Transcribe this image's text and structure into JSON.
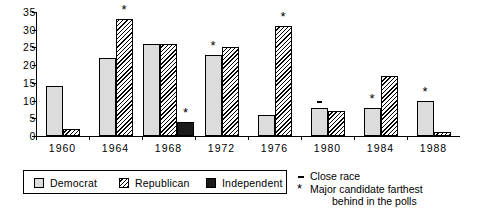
{
  "chart_data": {
    "type": "bar",
    "title": "",
    "xlabel": "",
    "ylabel": "",
    "ylim": [
      0,
      35
    ],
    "yticks": [
      0,
      5,
      10,
      15,
      20,
      25,
      30,
      35
    ],
    "grid": false,
    "legend_position": "bottom-left",
    "categories": [
      "1960",
      "1964",
      "1968",
      "1972",
      "1976",
      "1980",
      "1984",
      "1988"
    ],
    "series": [
      {
        "name": "Democrat",
        "values": [
          14,
          22,
          26,
          23,
          6,
          8,
          8,
          10
        ]
      },
      {
        "name": "Republican",
        "values": [
          2,
          33,
          26,
          25,
          31,
          7,
          17,
          1
        ]
      },
      {
        "name": "Independent",
        "values": [
          null,
          null,
          4,
          null,
          null,
          null,
          null,
          null
        ]
      }
    ],
    "annotations": [
      {
        "category": "1964",
        "series": "Republican",
        "symbol": "*",
        "meaning": "Major candidate farthest behind in the polls"
      },
      {
        "category": "1968",
        "series": "Independent",
        "symbol": "*",
        "meaning": "Major candidate farthest behind in the polls"
      },
      {
        "category": "1972",
        "series": "Democrat",
        "symbol": "*",
        "meaning": "Major candidate farthest behind in the polls"
      },
      {
        "category": "1976",
        "series": "Republican",
        "symbol": "*",
        "meaning": "Major candidate farthest behind in the polls"
      },
      {
        "category": "1980",
        "series": "Democrat",
        "symbol": "=",
        "meaning": "Close race"
      },
      {
        "category": "1984",
        "series": "Democrat",
        "symbol": "*",
        "meaning": "Major candidate farthest behind in the polls"
      },
      {
        "category": "1988",
        "series": "Democrat",
        "symbol": "*",
        "meaning": "Major candidate farthest behind in the polls"
      }
    ]
  },
  "legend": {
    "items": [
      {
        "label": "Democrat",
        "swatch": "light-gray-box"
      },
      {
        "label": "Republican",
        "swatch": "diagonal-hatch-box"
      },
      {
        "label": "Independent",
        "swatch": "solid-black-box"
      }
    ]
  },
  "notes": {
    "close_race": "Close race",
    "farthest_behind_line1": "Major candidate farthest",
    "farthest_behind_line2": "behind in the polls",
    "close_race_symbol": "=",
    "farthest_behind_symbol": "*"
  },
  "axis": {
    "y_labels": [
      "35",
      "30",
      "25",
      "20",
      "15",
      "10",
      "5",
      "0"
    ],
    "x_labels": [
      "1960",
      "1964",
      "1968",
      "1972",
      "1976",
      "1980",
      "1984",
      "1988"
    ]
  },
  "colors": {
    "democrat": "#dcdcdc",
    "republican": "#000000",
    "independent": "#1a1a1a",
    "axis": "#000000",
    "background": "#ffffff"
  }
}
